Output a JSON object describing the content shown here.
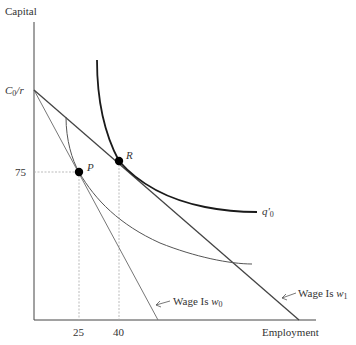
{
  "axes": {
    "y_label": "Capital",
    "x_label": "Employment",
    "y_ticks": [
      {
        "label_main": "C",
        "label_sub": "0",
        "label_rest": "/r",
        "name": "C0/r"
      },
      {
        "label": "75"
      }
    ],
    "x_ticks": [
      "25",
      "40"
    ]
  },
  "points": [
    {
      "label": "P",
      "employment": 25,
      "capital": 75
    },
    {
      "label": "R",
      "employment": 40,
      "capital": 78
    }
  ],
  "curves": {
    "isoquant_new": {
      "label_main": "q'",
      "label_sub": "0"
    },
    "isoquant_old": {
      "label": ""
    }
  },
  "isocost_lines": [
    {
      "prefix": "Wage Is ",
      "var": "w",
      "sub": "0"
    },
    {
      "prefix": "Wage Is ",
      "var": "w",
      "sub": "1"
    }
  ],
  "colors": {
    "axis": "#444444",
    "thick_curve": "#1a1a1a",
    "thin_curve": "#555555",
    "w0_line": "#777777",
    "w1_line": "#444444",
    "guide": "#aaaaaa",
    "point": "#000000"
  }
}
